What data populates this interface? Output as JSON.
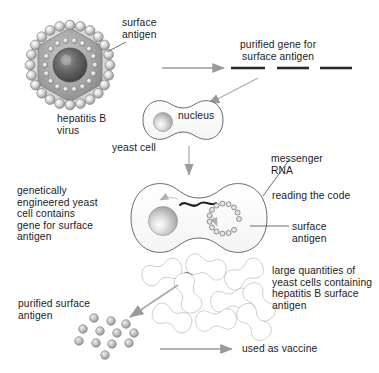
{
  "diagram": {
    "background_color": "#ffffff",
    "ink_color": "#1b1b1b",
    "arrow_color": "#8c8c8c",
    "sphere_color": "#b9b9b9",
    "sphere_highlight": "#f2f2f2",
    "outline_color": "#4a4a4a"
  },
  "labels": {
    "surface_antigen_virus": "surface\nantigen",
    "hepatitis_b_virus": "hepatitis B\nvirus",
    "purified_gene": "purified gene for\nsurface antigen",
    "nucleus": "nucleus",
    "yeast_cell": "yeast cell",
    "messenger_rna": "messenger\nRNA",
    "reading_the_code": "reading the code",
    "surface_antigen_cell": "surface\nantigen",
    "engineered_cell": "genetically\nengineered yeast\ncell contains\ngene for surface\nantigen",
    "large_quantities": "large quantities of\nyeast cells containing\nhepatitis B surface\nantigen",
    "purified_surface_antigen": "purified surface\nantigen",
    "used_as_vaccine": "used as vaccine"
  },
  "virus": {
    "outer_beads": 24,
    "inner_beads": 18,
    "core_label": "nucleocapsid core"
  },
  "cells": {
    "yeast_cell_count_in_mass": 9,
    "purified_antigen_dot_count": 12,
    "antigen_chain_bead_count": 14
  },
  "flow_steps": [
    "hepatitis B virus",
    "purified gene for surface antigen",
    "yeast cell",
    "genetically engineered yeast cell",
    "large quantities of yeast cells",
    "purified surface antigen",
    "used as vaccine"
  ]
}
